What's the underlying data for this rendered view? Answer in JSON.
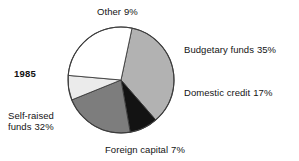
{
  "figure": {
    "year_label": "1985"
  },
  "chart_data": {
    "type": "pie",
    "title": "",
    "subtitle": "",
    "xlabel": "",
    "ylabel": "",
    "legend_position": "callout-labels",
    "grid": false,
    "year": "1985",
    "unit": "%",
    "categories": [
      "Budgetary funds",
      "Domestic credit",
      "Foreign capital",
      "Self-raised funds",
      "Other"
    ],
    "values": [
      35,
      17,
      7,
      32,
      9
    ],
    "slices": [
      {
        "name": "Budgetary funds",
        "label": "Budgetary funds",
        "percent": 35,
        "percent_text": "35%",
        "color": "#b2b2b2",
        "start_angle": 12,
        "end_angle": 139
      },
      {
        "name": "Domestic credit",
        "label": "Domestic credit",
        "percent": 17,
        "percent_text": "17%",
        "color": "#131313",
        "start_angle": 139,
        "end_angle": 170
      },
      {
        "name": "Foreign capital",
        "label": "Foreign capital",
        "percent": 7,
        "percent_text": "7%",
        "color": "#7d7d7d",
        "start_angle": 170,
        "end_angle": 248
      },
      {
        "name": "Self-raised funds",
        "label": "Self-raised funds",
        "percent": 32,
        "percent_text": "32%",
        "color": "#ebebeb",
        "start_angle": 248,
        "end_angle": 275
      },
      {
        "name": "Other",
        "label": "Other",
        "percent": 9,
        "percent_text": "9%",
        "color": "#ffffff",
        "start_angle": 275,
        "end_angle": 372
      }
    ],
    "outline_color": "#3c3c3c",
    "background_color": "#ffffff"
  },
  "labels": {
    "other": {
      "text": "Other",
      "pct": "9%"
    },
    "budgetary": {
      "text": "Budgetary funds",
      "pct": "35%"
    },
    "domestic": {
      "text": "Domestic credit",
      "pct": "17%"
    },
    "foreign": {
      "text": "Foreign capital",
      "pct": "7%"
    },
    "selfraised": {
      "text": "Self-raised",
      "text2": "funds",
      "pct": "32%"
    }
  }
}
